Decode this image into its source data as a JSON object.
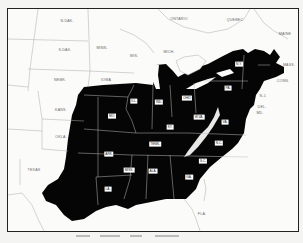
{
  "map": {
    "title": "Eastern United States (shaded region)",
    "fill_color": "#000000",
    "background_color": "#fbfbf9",
    "outline_color": "#999999",
    "unshaded_labels": [
      {
        "text": "N.DAK.",
        "x": 60,
        "y": 13
      },
      {
        "text": "S.DAK.",
        "x": 58,
        "y": 42
      },
      {
        "text": "MINN.",
        "x": 95,
        "y": 40
      },
      {
        "text": "WIS.",
        "x": 127,
        "y": 48
      },
      {
        "text": "MICH.",
        "x": 162,
        "y": 44
      },
      {
        "text": "NEBR.",
        "x": 53,
        "y": 72
      },
      {
        "text": "IOWA",
        "x": 99,
        "y": 72
      },
      {
        "text": "KANS.",
        "x": 54,
        "y": 102
      },
      {
        "text": "OKLA.",
        "x": 54,
        "y": 129
      },
      {
        "text": "TEXAS",
        "x": 27,
        "y": 162
      },
      {
        "text": "ONTARIO",
        "x": 172,
        "y": 11
      },
      {
        "text": "QUEBEC",
        "x": 228,
        "y": 12
      },
      {
        "text": "MAINE",
        "x": 278,
        "y": 26
      },
      {
        "text": "FLA.",
        "x": 195,
        "y": 206
      },
      {
        "text": "MASS.",
        "x": 282,
        "y": 57
      },
      {
        "text": "CONN.",
        "x": 276,
        "y": 73
      },
      {
        "text": "N.J.",
        "x": 256,
        "y": 88
      },
      {
        "text": "DEL.",
        "x": 255,
        "y": 99
      },
      {
        "text": "MD.",
        "x": 253,
        "y": 105
      }
    ],
    "shaded_labels": [
      {
        "text": "MO.",
        "x": 105,
        "y": 108
      },
      {
        "text": "ILL.",
        "x": 127,
        "y": 93
      },
      {
        "text": "IND.",
        "x": 152,
        "y": 94
      },
      {
        "text": "OHIO",
        "x": 180,
        "y": 90
      },
      {
        "text": "PA.",
        "x": 221,
        "y": 80
      },
      {
        "text": "N.Y.",
        "x": 232,
        "y": 56
      },
      {
        "text": "KY.",
        "x": 163,
        "y": 119
      },
      {
        "text": "W.VA.",
        "x": 192,
        "y": 109
      },
      {
        "text": "VA.",
        "x": 218,
        "y": 114
      },
      {
        "text": "TENN.",
        "x": 148,
        "y": 136
      },
      {
        "text": "N.C.",
        "x": 212,
        "y": 135
      },
      {
        "text": "ARK.",
        "x": 102,
        "y": 146
      },
      {
        "text": "S.C.",
        "x": 196,
        "y": 153
      },
      {
        "text": "MISS.",
        "x": 122,
        "y": 162
      },
      {
        "text": "ALA.",
        "x": 146,
        "y": 163
      },
      {
        "text": "GA.",
        "x": 182,
        "y": 169
      },
      {
        "text": "LA.",
        "x": 101,
        "y": 181
      }
    ]
  }
}
